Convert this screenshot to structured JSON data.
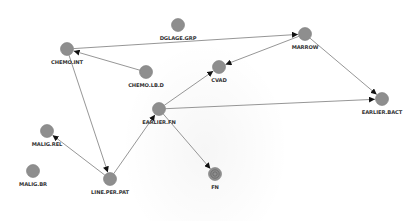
{
  "graph": {
    "colors": {
      "background": "#ffffff",
      "node_fill": "#8e8e8e",
      "node_stroke": "#7a7a7a",
      "edge": "#8a8a8a",
      "arrow": "#111111",
      "label": "#333333"
    },
    "node_radius": 6.5,
    "nodes": [
      {
        "id": "CHEMO.INT",
        "label": "CHEMO.INT",
        "x": 67,
        "y": 49
      },
      {
        "id": "DGLAGE.GRP",
        "label": "DGLAGE.GRP",
        "x": 178,
        "y": 25
      },
      {
        "id": "CHEMO.LB.D",
        "label": "CHEMO.LB.D",
        "x": 146,
        "y": 72
      },
      {
        "id": "MARROW",
        "label": "MARROW",
        "x": 305,
        "y": 34
      },
      {
        "id": "CVAD",
        "label": "CVAD",
        "x": 219,
        "y": 67
      },
      {
        "id": "EARLIER.FN",
        "label": "EARLIER.FN",
        "x": 159,
        "y": 109
      },
      {
        "id": "EARLIER.BACT",
        "label": "EARLIER.BACT",
        "x": 382,
        "y": 99
      },
      {
        "id": "MALIG.REL",
        "label": "MALIG.REL",
        "x": 47,
        "y": 131
      },
      {
        "id": "MALIG.BR",
        "label": "MALIG.BR",
        "x": 33,
        "y": 171
      },
      {
        "id": "LINE.PER.PAT",
        "label": "LINE.PER.PAT",
        "x": 110,
        "y": 179
      },
      {
        "id": "FN",
        "label": "FN",
        "x": 215,
        "y": 174,
        "style": "target"
      }
    ],
    "edges": [
      {
        "from": "CHEMO.INT",
        "to": "MARROW"
      },
      {
        "from": "CHEMO.LB.D",
        "to": "CHEMO.INT"
      },
      {
        "from": "CHEMO.INT",
        "to": "LINE.PER.PAT"
      },
      {
        "from": "MARROW",
        "to": "CVAD"
      },
      {
        "from": "MARROW",
        "to": "EARLIER.BACT"
      },
      {
        "from": "EARLIER.FN",
        "to": "CVAD"
      },
      {
        "from": "EARLIER.FN",
        "to": "EARLIER.BACT"
      },
      {
        "from": "EARLIER.FN",
        "to": "FN"
      },
      {
        "from": "LINE.PER.PAT",
        "to": "EARLIER.FN"
      },
      {
        "from": "LINE.PER.PAT",
        "to": "MALIG.REL"
      }
    ]
  }
}
